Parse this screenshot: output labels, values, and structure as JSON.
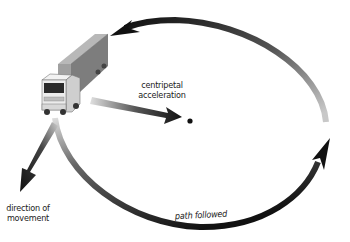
{
  "diagram": {
    "labels": {
      "centripetal_line1": "centripetal",
      "centripetal_line2": "acceleration",
      "direction_line1": "direction of",
      "direction_line2": "movement",
      "path": "path followed"
    },
    "elements": [
      {
        "name": "truck",
        "description": "semi-trailer truck"
      },
      {
        "name": "circular-path",
        "description": "elliptical path with arrows, counter-clockwise"
      },
      {
        "name": "centripetal-arrow",
        "description": "arrow from truck toward center"
      },
      {
        "name": "center-point",
        "description": "center of circular path"
      },
      {
        "name": "direction-arrow",
        "description": "tangent arrow showing direction of movement"
      }
    ],
    "colors": {
      "arrow_dark": "#111111",
      "arrow_fade": "#bbbbbb",
      "truck_box": "#8a8a8a",
      "truck_box_top": "#b5b5b5",
      "cab": "#e8e8e8"
    }
  }
}
